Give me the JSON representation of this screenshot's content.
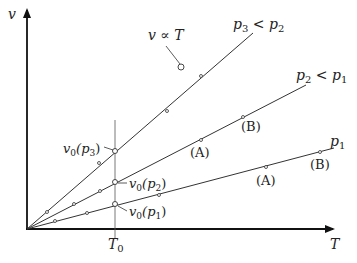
{
  "axes": {
    "y_label": "v",
    "x_label": "T",
    "x_tick_label": "T",
    "x_tick_sub": "0"
  },
  "lines": [
    {
      "id": "p1",
      "label_main": "p",
      "label_sub": "1",
      "label_rest": ""
    },
    {
      "id": "p2",
      "label_main": "p",
      "label_sub": "2",
      "label_rest": " < p",
      "label_sub2": "1"
    },
    {
      "id": "p3",
      "label_main": "p",
      "label_sub": "3",
      "label_rest": " < p",
      "label_sub2": "2"
    }
  ],
  "annotations": {
    "proportional": "v ∝ T",
    "v0_p3": {
      "main": "v",
      "sub": "0",
      "arg": "(p",
      "argsub": "3",
      "close": ")"
    },
    "v0_p2": {
      "main": "v",
      "sub": "0",
      "arg": "(p",
      "argsub": "2",
      "close": ")"
    },
    "v0_p1": {
      "main": "v",
      "sub": "0",
      "arg": "(p",
      "argsub": "1",
      "close": ")"
    },
    "A_p2": "(A)",
    "B_p2": "(B)",
    "A_p1": "(A)",
    "B_p1": "(B)"
  },
  "colors": {
    "line": "#333333",
    "axis": "#111111",
    "background": "#ffffff"
  }
}
